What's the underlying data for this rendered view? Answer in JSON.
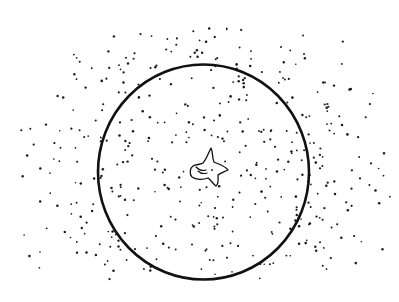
{
  "illustration": {
    "subject": "hand-drawn sketch",
    "elements": [
      "large circle",
      "scattered dots",
      "small creature at center"
    ],
    "ink_color": "#111111",
    "background_color": "#ffffff",
    "dot_count_approx": 420
  }
}
